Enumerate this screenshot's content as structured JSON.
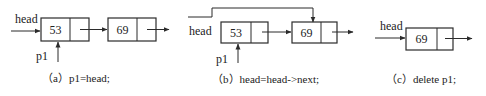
{
  "colors": {
    "stroke": "#2b2b2b",
    "background": "#ffffff"
  },
  "panels": [
    {
      "id": "a",
      "caption": "（a）p1=head;",
      "head_label": "head",
      "p1_label": "p1",
      "nodes": [
        {
          "value": "53"
        },
        {
          "value": "69"
        }
      ]
    },
    {
      "id": "b",
      "caption": "（b）head=head->next;",
      "head_label": "head",
      "p1_label": "p1",
      "nodes": [
        {
          "value": "53"
        },
        {
          "value": "69"
        }
      ]
    },
    {
      "id": "c",
      "caption": "（c）delete p1;",
      "head_label": "head",
      "nodes": [
        {
          "value": "69"
        }
      ]
    }
  ]
}
